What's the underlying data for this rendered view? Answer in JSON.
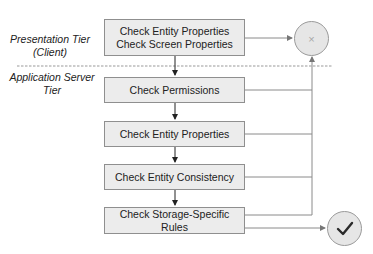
{
  "tiers": {
    "presentation": {
      "line1": "Presentation Tier",
      "line2": "(Client)"
    },
    "application": {
      "line1": "Application Server",
      "line2": "Tier"
    }
  },
  "boxes": [
    {
      "lines": [
        "Check Entity Properties",
        "Check Screen Properties"
      ]
    },
    {
      "lines": [
        "Check Permissions"
      ]
    },
    {
      "lines": [
        "Check Entity Properties"
      ]
    },
    {
      "lines": [
        "Check Entity Consistency"
      ]
    },
    {
      "lines": [
        "Check Storage-Specific Rules"
      ]
    }
  ],
  "outcomes": {
    "failure": {
      "icon": "x-icon",
      "glyph": "×"
    },
    "success": {
      "icon": "checkmark-icon",
      "glyph": "✓"
    }
  },
  "colors": {
    "box_fill": "#ececec",
    "box_border": "#8f8f8f",
    "line": "#8a8a8a",
    "arrow": "#222222",
    "circle_fill": "#e6e6e6",
    "divider": "#9a9a9a"
  }
}
